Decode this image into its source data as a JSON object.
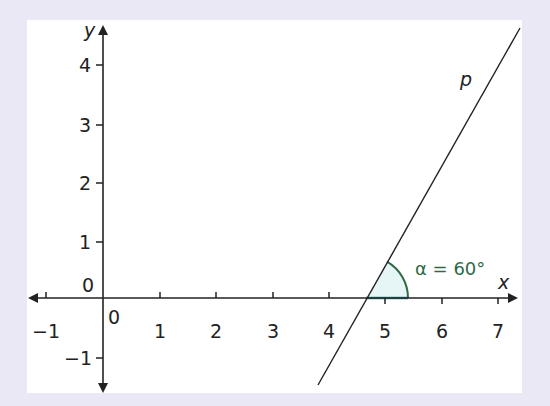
{
  "diagram": {
    "type": "coordinate-geometry",
    "axes": {
      "x_label": "x",
      "y_label": "y",
      "origin_label": "0",
      "y_zero_label": "0",
      "x_ticks": [
        "-1",
        "1",
        "2",
        "3",
        "4",
        "5",
        "6",
        "7"
      ],
      "y_ticks": [
        "4",
        "3",
        "2",
        "1",
        "-1"
      ],
      "x_range": [
        -1.3,
        7.3
      ],
      "y_range": [
        -1.6,
        4.6
      ]
    },
    "line": {
      "label": "p",
      "x_intercept": 4.65,
      "angle_deg": 60
    },
    "angle": {
      "label": "α = 60°",
      "symbol": "α",
      "value": "60°"
    },
    "colors": {
      "border": "#ebe8f6",
      "panel": "#ffffff",
      "axis": "#222222",
      "angle_arc": "#2e6b45",
      "angle_fill": "#e6f6f6",
      "angle_base": "#2a8e8e"
    }
  }
}
